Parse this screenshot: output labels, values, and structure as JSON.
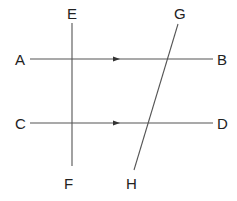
{
  "diagram": {
    "title": "",
    "colors": {
      "line": "#555555",
      "label": "#222222",
      "background": "#ffffff"
    },
    "labels": {
      "A": "A",
      "B": "B",
      "C": "C",
      "D": "D",
      "E": "E",
      "F": "F",
      "G": "G",
      "H": "H"
    },
    "lines": [
      {
        "id": "AB",
        "from": "A",
        "to": "B",
        "type": "horizontal",
        "arrow": "midpoint, pointing toward B"
      },
      {
        "id": "CD",
        "from": "C",
        "to": "D",
        "type": "horizontal",
        "arrow": "midpoint, pointing toward D"
      },
      {
        "id": "EF",
        "from": "E",
        "to": "F",
        "type": "vertical transversal"
      },
      {
        "id": "GH",
        "from": "G",
        "to": "H",
        "type": "oblique transversal"
      }
    ],
    "relationships": [
      "AB parallel to CD (indicated by arrow marks)",
      "EF crosses AB and CD",
      "GH crosses AB and CD"
    ]
  }
}
